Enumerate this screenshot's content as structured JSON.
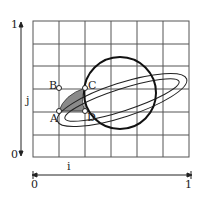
{
  "diagram": {
    "title": "",
    "grid": {
      "cols": 6,
      "rows": 6
    },
    "axes": {
      "vertical": {
        "label": "j",
        "min_label": "0",
        "max_label": "1"
      },
      "horizontal": {
        "label": "i",
        "min_label": "0",
        "max_label": "1"
      }
    },
    "points": [
      {
        "name": "A",
        "label": "A"
      },
      {
        "name": "B",
        "label": "B"
      },
      {
        "name": "C",
        "label": "C"
      },
      {
        "name": "D",
        "label": "D"
      }
    ],
    "shapes": {
      "planet": "circle",
      "ring": "ellipse",
      "shaded_region": "ABCD"
    },
    "colors": {
      "line": "#222222",
      "grid": "#555555",
      "fill": "#8a8a8a",
      "background": "#ffffff"
    }
  }
}
